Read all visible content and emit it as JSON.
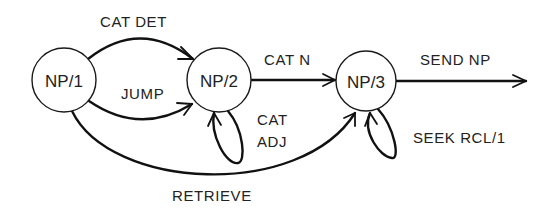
{
  "diagram": {
    "type": "augmented-transition-network",
    "nodes": [
      {
        "id": "np1",
        "label": "NP/1",
        "cx": 64,
        "cy": 80,
        "r": 32
      },
      {
        "id": "np2",
        "label": "NP/2",
        "cx": 219,
        "cy": 80,
        "r": 32
      },
      {
        "id": "np3",
        "label": "NP/3",
        "cx": 366,
        "cy": 81,
        "r": 30
      }
    ],
    "edges": [
      {
        "id": "cat-det",
        "from": "NP/1",
        "to": "NP/2",
        "label": "CAT DET"
      },
      {
        "id": "jump",
        "from": "NP/1",
        "to": "NP/2",
        "label": "JUMP"
      },
      {
        "id": "cat-n",
        "from": "NP/2",
        "to": "NP/3",
        "label": "CAT N"
      },
      {
        "id": "cat-adj",
        "from": "NP/2",
        "to": "NP/2",
        "label_line1": "CAT",
        "label_line2": "ADJ"
      },
      {
        "id": "retrieve",
        "from": "NP/1",
        "to": "NP/3",
        "label": "RETRIEVE"
      },
      {
        "id": "seek-rcl",
        "from": "NP/3",
        "to": "NP/3",
        "label": "SEEK RCL/1"
      },
      {
        "id": "send-np",
        "from": "NP/3",
        "to": "exit",
        "label": "SEND NP"
      }
    ],
    "colors": {
      "stroke": "#111111",
      "text": "#222222",
      "background": "#ffffff"
    }
  }
}
